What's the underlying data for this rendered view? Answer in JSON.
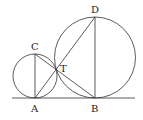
{
  "diagram": {
    "labels": {
      "A": "A",
      "B": "B",
      "C": "C",
      "D": "D",
      "T": "T"
    },
    "points": {
      "A": [
        35,
        98
      ],
      "B": [
        95,
        98
      ],
      "C": [
        35,
        53
      ],
      "D": [
        95,
        17
      ],
      "T": [
        56,
        69
      ]
    },
    "circles": [
      {
        "name": "small",
        "center": [
          35,
          76
        ],
        "r": 22
      },
      {
        "name": "large",
        "center": [
          95,
          58
        ],
        "r": 40
      }
    ],
    "colors": {
      "stroke": "#333333"
    }
  }
}
